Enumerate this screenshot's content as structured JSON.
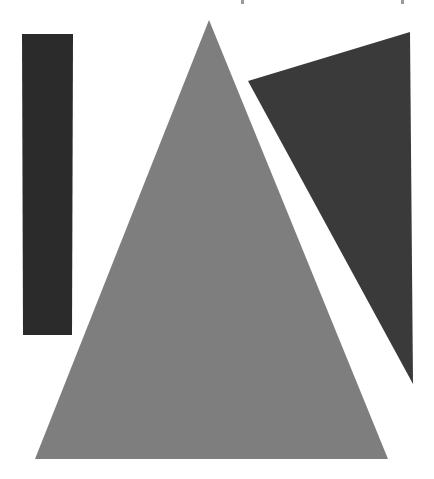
{
  "scene": {
    "description": "Three dark/grey geometric shapes on a white background",
    "background_color": "#ffffff",
    "shapes": [
      {
        "name": "tall-rectangle",
        "kind": "rectangle",
        "color": "#2b2b2b",
        "points": "22,34 73,34 72,335 23,335"
      },
      {
        "name": "large-triangle",
        "kind": "triangle",
        "color": "#7e7e7e",
        "points": "209,20 388,459 35,459"
      },
      {
        "name": "dark-triangle",
        "kind": "triangle",
        "color": "#3a3a3a",
        "points": "248,81 410,32 413,384"
      }
    ]
  }
}
